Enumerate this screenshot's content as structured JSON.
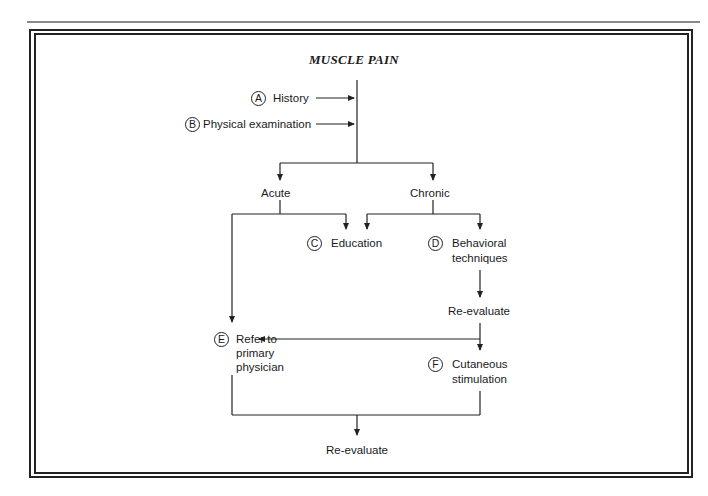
{
  "title": "MUSCLE PAIN",
  "inputs": [
    {
      "letter": "A",
      "label": "History"
    },
    {
      "letter": "B",
      "label": "Physical examination"
    }
  ],
  "branches": {
    "acute": "Acute",
    "chronic": "Chronic"
  },
  "nodes": {
    "education": {
      "letter": "C",
      "label": "Education"
    },
    "behavioral": {
      "letter": "D",
      "line1": "Behavioral",
      "line2": "techniques"
    },
    "reevaluate_mid": "Re-evaluate",
    "refer": {
      "letter": "E",
      "line1": "Refer to",
      "line2": "primary",
      "line3": "physician"
    },
    "cutaneous": {
      "letter": "F",
      "line1": "Cutaneous",
      "line2": "stimulation"
    },
    "reevaluate_final": "Re-evaluate"
  },
  "edges": [
    {
      "from": "History",
      "to": "main-trunk"
    },
    {
      "from": "Physical examination",
      "to": "main-trunk"
    },
    {
      "from": "main-trunk",
      "to": "Acute"
    },
    {
      "from": "main-trunk",
      "to": "Chronic"
    },
    {
      "from": "Acute",
      "to": "Education"
    },
    {
      "from": "Acute",
      "to": "Refer to primary physician"
    },
    {
      "from": "Chronic",
      "to": "Education"
    },
    {
      "from": "Chronic",
      "to": "Behavioral techniques"
    },
    {
      "from": "Behavioral techniques",
      "to": "Re-evaluate"
    },
    {
      "from": "Re-evaluate",
      "to": "Refer to primary physician"
    },
    {
      "from": "Re-evaluate",
      "to": "Cutaneous stimulation"
    },
    {
      "from": "Refer to primary physician",
      "to": "Re-evaluate (final)"
    },
    {
      "from": "Cutaneous stimulation",
      "to": "Re-evaluate (final)"
    }
  ]
}
